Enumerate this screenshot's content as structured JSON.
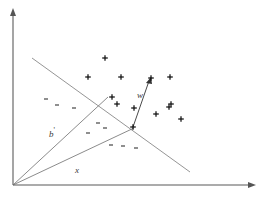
{
  "figure": {
    "width": 264,
    "height": 200,
    "background_color": "#ffffff"
  },
  "labels": {
    "w": {
      "text": "w",
      "x": 137,
      "y": 91,
      "style": "italic"
    },
    "b_prime": {
      "text": "b",
      "prime": "'",
      "x": 49,
      "y": 127,
      "style": "italic"
    },
    "x": {
      "text": "x",
      "x": 75,
      "y": 166,
      "style": "italic"
    }
  },
  "axes": {
    "color": "#8f8f8f",
    "origin": {
      "x": 13,
      "y": 185
    },
    "y_axis": {
      "x1": 13,
      "y1": 185,
      "x2": 13,
      "y2": 10,
      "arrow": "up"
    },
    "x_axis": {
      "x1": 13,
      "y1": 185,
      "x2": 255,
      "y2": 185,
      "arrow": "right"
    }
  },
  "lines": {
    "decision_boundary": {
      "name": "decision-boundary",
      "color": "#7a7a7a",
      "x1": 32,
      "y1": 58,
      "x2": 190,
      "y2": 172
    },
    "ray_b_prime": {
      "name": "ray-b-prime",
      "color": "#6d6d6d",
      "x1": 13,
      "y1": 185,
      "x2": 108,
      "y2": 97
    },
    "ray_x": {
      "name": "ray-x",
      "color": "#6d6d6d",
      "x1": 13,
      "y1": 185,
      "x2": 134,
      "y2": 128
    },
    "vector_w": {
      "name": "vector-w",
      "color": "#4a4a4a",
      "x1": 133,
      "y1": 127,
      "x2": 151,
      "y2": 78,
      "arrow": "true"
    }
  },
  "chart_data": {
    "type": "scatter",
    "xlabel": "",
    "ylabel": "",
    "grid": false,
    "legend": false,
    "xlim": [
      0,
      264
    ],
    "ylim": [
      0,
      200
    ],
    "series": [
      {
        "name": "positive",
        "marker": "plus",
        "color": "#111111",
        "count": 13,
        "points": [
          {
            "x": 105,
            "y": 58
          },
          {
            "x": 88,
            "y": 77
          },
          {
            "x": 121,
            "y": 77
          },
          {
            "x": 112,
            "y": 97
          },
          {
            "x": 117,
            "y": 104
          },
          {
            "x": 151,
            "y": 78
          },
          {
            "x": 170,
            "y": 77
          },
          {
            "x": 134,
            "y": 108
          },
          {
            "x": 171,
            "y": 104
          },
          {
            "x": 169,
            "y": 107
          },
          {
            "x": 156,
            "y": 114
          },
          {
            "x": 181,
            "y": 119
          },
          {
            "x": 133,
            "y": 127
          }
        ]
      },
      {
        "name": "negative",
        "marker": "minus",
        "color": "#333333",
        "count": 9,
        "points": [
          {
            "x": 46,
            "y": 99
          },
          {
            "x": 57,
            "y": 105
          },
          {
            "x": 74,
            "y": 108
          },
          {
            "x": 98,
            "y": 123
          },
          {
            "x": 105,
            "y": 128
          },
          {
            "x": 88,
            "y": 133
          },
          {
            "x": 111,
            "y": 145
          },
          {
            "x": 123,
            "y": 146
          },
          {
            "x": 136,
            "y": 148
          }
        ]
      }
    ],
    "annotations": [
      {
        "text": "w",
        "x": 137,
        "y": 91,
        "kind": "vector-label"
      },
      {
        "text": "b'",
        "x": 49,
        "y": 127,
        "kind": "ray-label"
      },
      {
        "text": "x",
        "x": 75,
        "y": 166,
        "kind": "ray-label"
      }
    ]
  }
}
